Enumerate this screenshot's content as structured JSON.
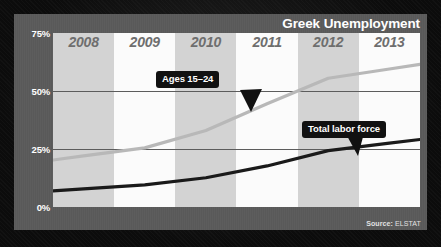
{
  "chart_title": "Greek Unemployment",
  "source": {
    "label": "Source:",
    "value": "ELSTAT"
  },
  "axis": {
    "y_ticks": [
      "75%",
      "50%",
      "25%",
      "0%"
    ],
    "x_ticks": [
      "2008",
      "2009",
      "2010",
      "2011",
      "2012",
      "2013"
    ]
  },
  "callouts": {
    "youth": "Ages 15–24",
    "total": "Total labor force"
  },
  "colors": {
    "background": "#0c0c0c",
    "panel": "#5a5a5a",
    "plot": "#fbfbfb",
    "band_shaded": "#d3d3d3",
    "gridline": "#5c5c5c",
    "youth_line": "#b8b8b8",
    "total_line": "#1a1a1a",
    "title_text": "#ffffff",
    "year_text": "#6e6e6e"
  },
  "chart_data": {
    "type": "line",
    "title": "Greek Unemployment",
    "xlabel": "",
    "ylabel": "",
    "ylim": [
      0,
      75
    ],
    "ytick_values": [
      75,
      50,
      25,
      0
    ],
    "grid": true,
    "legend": "annotations",
    "x": [
      "2008",
      "2009",
      "2010",
      "2011",
      "2012",
      "2013"
    ],
    "series": [
      {
        "name": "Ages 15–24",
        "color": "#b8b8b8",
        "values": [
          22.0,
          25.5,
          33.0,
          44.5,
          55.5,
          59.5
        ]
      },
      {
        "name": "Total labor force",
        "color": "#1a1a1a",
        "values": [
          7.8,
          9.5,
          12.6,
          17.7,
          24.3,
          27.5
        ]
      }
    ],
    "annotations": [
      {
        "text": "Ages 15–24",
        "points_to": "Ages 15–24 series near 2011"
      },
      {
        "text": "Total labor force",
        "points_to": "Total labor force series near 2012"
      }
    ]
  }
}
